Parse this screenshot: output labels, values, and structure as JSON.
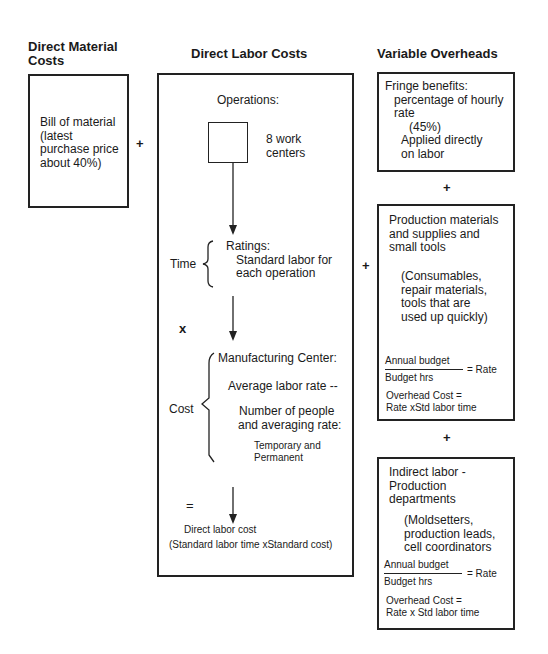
{
  "headers": {
    "direct_material": "Direct Material\nCosts",
    "direct_material_line1": "Direct Material",
    "direct_material_line2": "Costs",
    "direct_labor": "Direct Labor Costs",
    "variable_overheads": "Variable Overheads"
  },
  "material_box": {
    "lines": [
      "Bill of material",
      "(latest",
      "purchase price",
      "about 40%)"
    ]
  },
  "operators": {
    "plus": "+",
    "times": "x",
    "equals": "="
  },
  "labor_box": {
    "operations_label": "Operations:",
    "work_centers": [
      "8 work",
      "centers"
    ],
    "time_label": "Time",
    "ratings": [
      "Ratings:",
      "Standard labor for",
      "each operation"
    ],
    "cost_label": "Cost",
    "manufacturing_center": "Manufacturing Center:",
    "average_rate": "Average labor rate --",
    "people_rate": [
      "Number of people",
      "and averaging rate:"
    ],
    "temp_perm": [
      "Temporary and",
      "Permanent"
    ],
    "result": "Direct labor cost",
    "result_formula": "(Standard labor time xStandard cost)"
  },
  "overhead_boxes": [
    {
      "title": "Fringe benefits:",
      "lines": [
        "percentage of hourly",
        "rate"
      ],
      "percent": "(45%)",
      "applied": [
        "Applied directly",
        "on labor"
      ]
    },
    {
      "title_lines": [
        "Production materials",
        "and supplies and",
        "small tools"
      ],
      "detail_lines": [
        "(Consumables,",
        "repair materials,",
        "tools that are",
        "used up quickly)"
      ],
      "numerator": "Annual budget",
      "denominator": "Budget hrs",
      "rate": "= Rate",
      "overhead": [
        "Overhead Cost =",
        "Rate xStd labor time"
      ]
    },
    {
      "title_lines": [
        "Indirect labor -",
        "Production",
        "departments"
      ],
      "detail_lines": [
        "(Moldsetters,",
        "production leads,",
        "cell coordinators"
      ],
      "numerator": "Annual budget",
      "denominator": "Budget hrs",
      "rate": "= Rate",
      "overhead": [
        "Overhead Cost =",
        "Rate x Std labor time"
      ]
    }
  ]
}
